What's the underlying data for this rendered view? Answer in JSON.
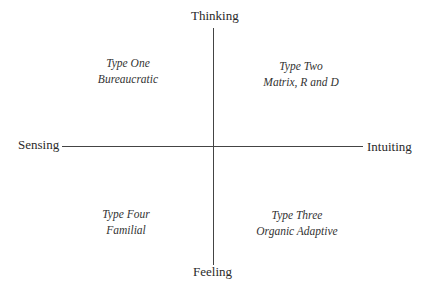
{
  "diagram": {
    "type": "quadrant",
    "axes": {
      "top": "Thinking",
      "bottom": "Feeling",
      "left": "Sensing",
      "right": "Intuiting"
    },
    "quadrants": [
      {
        "position": "top-left",
        "title": "Type One",
        "subtitle": "Bureaucratic"
      },
      {
        "position": "top-right",
        "title": "Type Two",
        "subtitle": "Matrix, R and D"
      },
      {
        "position": "bottom-right",
        "title": "Type Three",
        "subtitle": "Organic Adaptive"
      },
      {
        "position": "bottom-left",
        "title": "Type Four",
        "subtitle": "Familial"
      }
    ]
  }
}
